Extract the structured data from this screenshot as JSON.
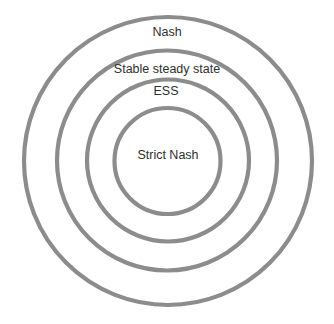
{
  "diagram": {
    "type": "nested-circles",
    "stroke_color": "#8c8c8c",
    "text_color": "#2e2e2e",
    "background": "#ffffff",
    "rings": [
      {
        "label": "Nash",
        "cx": 168,
        "cy": 161,
        "r": 144,
        "label_x": 167,
        "label_y": 32
      },
      {
        "label": "Stable steady state",
        "cx": 167,
        "cy": 160.5,
        "r": 110,
        "label_x": 167,
        "label_y": 69
      },
      {
        "label": "ESS",
        "cx": 168,
        "cy": 160.5,
        "r": 81,
        "label_x": 166,
        "label_y": 91
      },
      {
        "label": "Strict Nash",
        "cx": 167.5,
        "cy": 161,
        "r": 53,
        "label_x": 168,
        "label_y": 155
      }
    ]
  }
}
